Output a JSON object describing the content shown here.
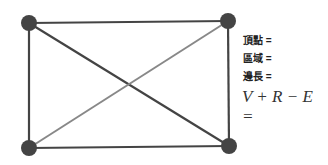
{
  "diagram": {
    "nodes": [
      {
        "id": "tl",
        "x": 29,
        "y": 23
      },
      {
        "id": "tr",
        "x": 228,
        "y": 21
      },
      {
        "id": "bl",
        "x": 29,
        "y": 148
      },
      {
        "id": "br",
        "x": 229,
        "y": 146
      }
    ],
    "edges": [
      {
        "from": "tl",
        "to": "tr",
        "color": "#444444"
      },
      {
        "from": "tr",
        "to": "br",
        "color": "#444444"
      },
      {
        "from": "br",
        "to": "bl",
        "color": "#444444"
      },
      {
        "from": "bl",
        "to": "tl",
        "color": "#444444"
      },
      {
        "from": "tl",
        "to": "br",
        "color": "#444444"
      },
      {
        "from": "tr",
        "to": "bl",
        "color": "#888888"
      }
    ],
    "node_color": "#444444"
  },
  "labels": {
    "vertices": "頂點 =",
    "regions": "區域 =",
    "edges": "邊長 =",
    "formula": "V + R − E ="
  }
}
